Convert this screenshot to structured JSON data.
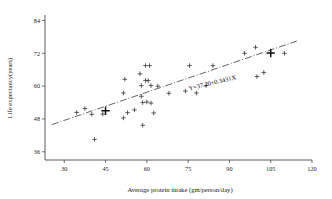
{
  "chart_data": {
    "type": "scatter",
    "title": "",
    "xlabel": "Average protein intake (gm/person/day)",
    "ylabel": "Life expectancy(years)",
    "xlim": [
      23,
      120
    ],
    "ylim": [
      33,
      86
    ],
    "xticks": [
      30,
      45,
      60,
      75,
      90,
      105,
      120
    ],
    "xtick_labels": [
      "30",
      "45",
      "60",
      "75",
      "90",
      "105",
      "120"
    ],
    "yticks": [
      36,
      48,
      60,
      72,
      84
    ],
    "ytick_labels": [
      "36",
      "48",
      "60",
      "72",
      "84"
    ],
    "grid": false,
    "legend": null,
    "marker": "plus",
    "annotations": [
      {
        "text": "Y=37.20+0.3431X",
        "x": 84,
        "y": 60.5,
        "rotation": -13.5
      }
    ],
    "fit_line": {
      "type": "linear",
      "intercept": 37.2,
      "slope": 0.3431,
      "equation": "Y=37.20+0.3431X",
      "x_start": 25.5,
      "x_end": 114.5,
      "style": "dash-dot"
    },
    "points": [
      {
        "x": 34.5,
        "y": 50.4
      },
      {
        "x": 37.5,
        "y": 51.8
      },
      {
        "x": 40.0,
        "y": 49.7
      },
      {
        "x": 41.0,
        "y": 40.5
      },
      {
        "x": 45.0,
        "y": 51.0,
        "emphasis": true
      },
      {
        "x": 44.0,
        "y": 49.8
      },
      {
        "x": 51.5,
        "y": 57.5
      },
      {
        "x": 51.5,
        "y": 48.4
      },
      {
        "x": 52.0,
        "y": 62.5
      },
      {
        "x": 53.0,
        "y": 50.3
      },
      {
        "x": 55.5,
        "y": 51.3
      },
      {
        "x": 57.5,
        "y": 64.5
      },
      {
        "x": 58.0,
        "y": 56.3
      },
      {
        "x": 58.0,
        "y": 60.2
      },
      {
        "x": 58.5,
        "y": 54.0
      },
      {
        "x": 58.5,
        "y": 45.7
      },
      {
        "x": 59.5,
        "y": 67.5
      },
      {
        "x": 59.5,
        "y": 62.1
      },
      {
        "x": 60.0,
        "y": 54.2
      },
      {
        "x": 60.5,
        "y": 62.0
      },
      {
        "x": 61.0,
        "y": 67.5
      },
      {
        "x": 61.5,
        "y": 60.2
      },
      {
        "x": 61.5,
        "y": 53.8
      },
      {
        "x": 62.5,
        "y": 50.2
      },
      {
        "x": 64.0,
        "y": 60.0
      },
      {
        "x": 68.0,
        "y": 57.4
      },
      {
        "x": 75.5,
        "y": 67.5
      },
      {
        "x": 74.0,
        "y": 58.2
      },
      {
        "x": 78.0,
        "y": 57.5
      },
      {
        "x": 81.5,
        "y": 60.2
      },
      {
        "x": 84.0,
        "y": 67.5
      },
      {
        "x": 95.5,
        "y": 72.0
      },
      {
        "x": 99.5,
        "y": 74.2
      },
      {
        "x": 100.0,
        "y": 63.5
      },
      {
        "x": 102.5,
        "y": 65.0
      },
      {
        "x": 105.0,
        "y": 72.1,
        "emphasis": true
      },
      {
        "x": 110.0,
        "y": 72.0
      }
    ]
  }
}
